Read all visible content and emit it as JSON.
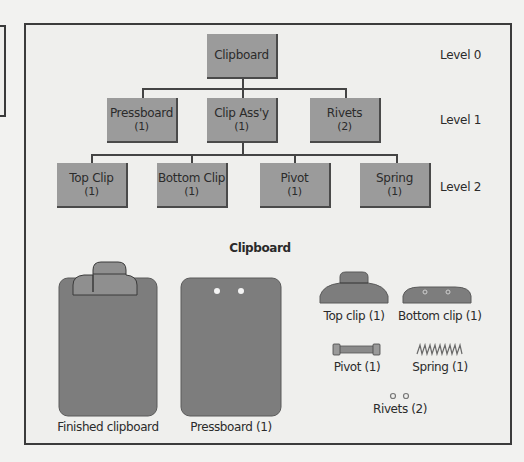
{
  "diagram": {
    "title": "Clipboard",
    "levels": [
      {
        "label": "Level 0"
      },
      {
        "label": "Level 1"
      },
      {
        "label": "Level 2"
      }
    ],
    "nodes": {
      "clipboard": {
        "name": "Clipboard",
        "qty": ""
      },
      "pressboard": {
        "name": "Pressboard",
        "qty": "(1)"
      },
      "clip_assy": {
        "name": "Clip Ass'y",
        "qty": "(1)"
      },
      "rivets": {
        "name": "Rivets",
        "qty": "(2)"
      },
      "top_clip": {
        "name": "Top Clip",
        "qty": "(1)"
      },
      "bottom_clip": {
        "name": "Bottom Clip",
        "qty": "(1)"
      },
      "pivot": {
        "name": "Pivot",
        "qty": "(1)"
      },
      "spring": {
        "name": "Spring",
        "qty": "(1)"
      }
    },
    "edges": [
      [
        "clipboard",
        "pressboard"
      ],
      [
        "clipboard",
        "clip_assy"
      ],
      [
        "clipboard",
        "rivets"
      ],
      [
        "clip_assy",
        "top_clip"
      ],
      [
        "clip_assy",
        "bottom_clip"
      ],
      [
        "clip_assy",
        "pivot"
      ],
      [
        "clip_assy",
        "spring"
      ]
    ]
  },
  "illustration": {
    "title": "Clipboard",
    "captions": {
      "finished": "Finished clipboard",
      "pressboard": "Pressboard (1)",
      "top_clip": "Top clip (1)",
      "bottom_clip": "Bottom clip (1)",
      "pivot": "Pivot (1)",
      "spring": "Spring (1)",
      "rivets": "Rivets (2)"
    }
  },
  "colors": {
    "node_fill": "#9b9b9b",
    "part_fill": "#7d7d7d",
    "clip_fill": "#8a8a8a",
    "background": "#efefed",
    "border": "#3c3c3c"
  }
}
